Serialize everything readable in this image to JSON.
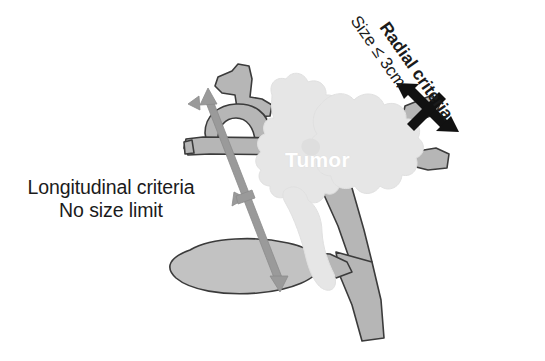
{
  "figure": {
    "name": "biliary-tumor-extent-criteria-diagram",
    "background_color": "#ffffff"
  },
  "labels": {
    "longitudinal": {
      "line_1": "Longitudinal criteria",
      "line_2": "No size limit"
    },
    "radial": {
      "line_1": "Radial criteria",
      "line_2": "Size ≤ 3cm"
    },
    "tumor": "Tumor"
  },
  "colors": {
    "duct_fill": "#b6b6b6",
    "duct_outline": "#3b3b3b",
    "gallbladder_fill": "#c2c2c2",
    "tumor_fill": "#e6e6e6",
    "tumor_edge": "#dcdcdc",
    "radial_arrow": "#111111",
    "longitudinal_arrow": "#9a9a9a",
    "text": "#1b1b1b",
    "tumor_label_text": "#ffffff"
  },
  "annotations": {
    "radial_arrow_name": "radial-measurement-arrow",
    "longitudinal_arrow_name": "longitudinal-measurement-arrow",
    "radial_rotation_deg": 55
  }
}
